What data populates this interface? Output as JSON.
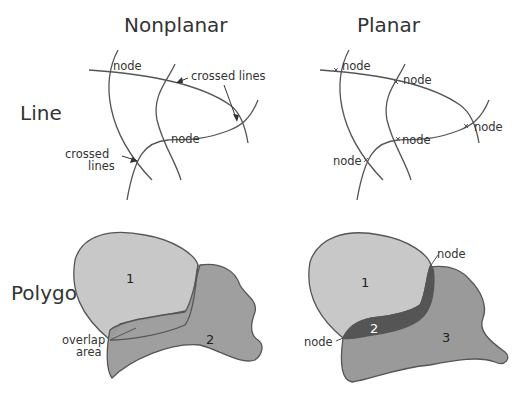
{
  "columns": {
    "nonplanar": "Nonplanar",
    "planar": "Planar"
  },
  "rows": {
    "line": "Line",
    "polygon": "Polygon"
  },
  "nonplanar_line": {
    "node_top": "node",
    "node_mid": "node",
    "crossed_lines_right": "crossed lines",
    "crossed_lines_left_1": "crossed",
    "crossed_lines_left_2": "lines"
  },
  "planar_line": {
    "node_1": "node",
    "node_2": "node",
    "node_3": "node",
    "node_4": "node",
    "node_5": "node"
  },
  "nonplanar_polygon": {
    "label_1": "1",
    "label_2": "2",
    "overlap_1": "overlap",
    "overlap_2": "area"
  },
  "planar_polygon": {
    "label_1": "1",
    "label_2": "2",
    "label_3": "3",
    "node_top": "node",
    "node_left": "node"
  },
  "colors": {
    "polygon_light": "#c8c8c8",
    "polygon_medium": "#9a9a9a",
    "polygon_dark": "#555555",
    "stroke": "#555555"
  }
}
